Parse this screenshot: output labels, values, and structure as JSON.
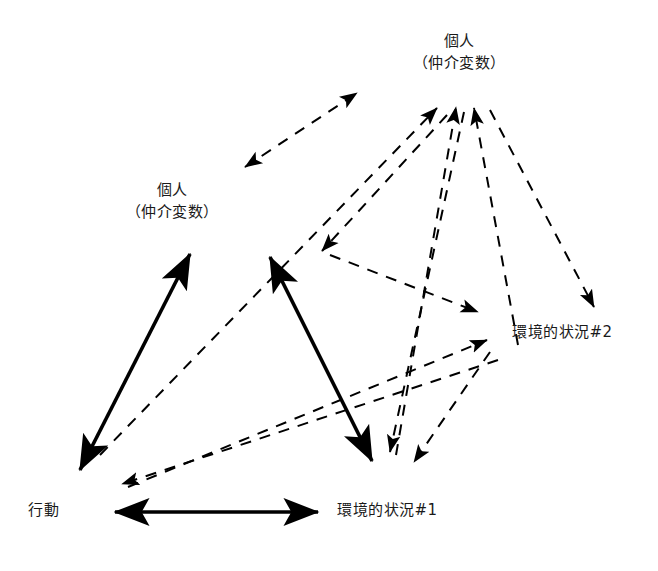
{
  "diagram": {
    "background_color": "#ffffff",
    "stroke_color": "#000000",
    "nodes": [
      {
        "id": "person-top",
        "line1": "個人",
        "line2": "（仲介変数）",
        "x": 459,
        "y": 60
      },
      {
        "id": "person-left",
        "line1": "個人",
        "line2": "（仲介変数）",
        "x": 172,
        "y": 209
      },
      {
        "id": "env2",
        "line1": "環境的状況#2",
        "line2": "",
        "x": 582,
        "y": 336
      },
      {
        "id": "env1",
        "line1": "環境的状況#1",
        "line2": "",
        "x": 407,
        "y": 514
      },
      {
        "id": "behavior",
        "line1": "行動",
        "line2": "",
        "x": 48,
        "y": 514
      }
    ],
    "edges": [
      {
        "id": "solid-person-left-behavior",
        "style": "solid",
        "heads": "both",
        "from": "person-left",
        "to": "behavior",
        "x1": 190,
        "y1": 254,
        "x2": 80,
        "y2": 470
      },
      {
        "id": "solid-person-left2-env1",
        "style": "solid",
        "heads": "both",
        "from": "person-left",
        "to": "env1",
        "x1": 270,
        "y1": 257,
        "x2": 372,
        "y2": 461
      },
      {
        "id": "solid-behavior-env1",
        "style": "solid",
        "heads": "both",
        "from": "behavior",
        "to": "env1",
        "x1": 115,
        "y1": 512,
        "x2": 318,
        "y2": 512
      },
      {
        "id": "dashed-person-left-person-top",
        "style": "dashed",
        "heads": "both",
        "from": "person-left",
        "to": "person-top",
        "x1": 245,
        "y1": 167,
        "x2": 357,
        "y2": 93
      },
      {
        "id": "dashed-behavior-person-top",
        "style": "dashed",
        "heads": "end",
        "from": "behavior",
        "to": "person-top",
        "x1": 100,
        "y1": 455,
        "x2": 437,
        "y2": 108
      },
      {
        "id": "dashed-env1-person-top",
        "style": "dashed",
        "heads": "end",
        "from": "env1",
        "to": "person-top",
        "x1": 396,
        "y1": 455,
        "x2": 456,
        "y2": 107
      },
      {
        "id": "dashed-env2-person-top",
        "style": "dashed",
        "heads": "end",
        "from": "env2",
        "to": "person-top",
        "x1": 518,
        "y1": 345,
        "x2": 474,
        "y2": 108
      },
      {
        "id": "dashed-person-top-env2",
        "style": "dashed",
        "heads": "end",
        "from": "person-top",
        "to": "env2",
        "x1": 490,
        "y1": 110,
        "x2": 594,
        "y2": 307
      },
      {
        "id": "dashed-person-top-person-left-mid",
        "style": "dashed",
        "heads": "end",
        "from": "person-top",
        "to": "person-left",
        "x1": 447,
        "y1": 115,
        "x2": 322,
        "y2": 251
      },
      {
        "id": "dashed-person-left-env2",
        "style": "dashed",
        "heads": "end",
        "from": "person-left",
        "to": "env2",
        "x1": 330,
        "y1": 255,
        "x2": 478,
        "y2": 312
      },
      {
        "id": "dashed-behavior-env2",
        "style": "dashed",
        "heads": "end",
        "from": "behavior",
        "to": "env2",
        "x1": 128,
        "y1": 487,
        "x2": 487,
        "y2": 340
      },
      {
        "id": "dashed-env2-behavior",
        "style": "dashed",
        "heads": "end",
        "from": "env2",
        "to": "behavior",
        "x1": 498,
        "y1": 360,
        "x2": 122,
        "y2": 484
      },
      {
        "id": "dashed-person-top-env1",
        "style": "dashed",
        "heads": "end",
        "from": "person-top",
        "to": "env1",
        "x1": 464,
        "y1": 112,
        "x2": 390,
        "y2": 452
      },
      {
        "id": "dashed-env2-env1",
        "style": "dashed",
        "heads": "end",
        "from": "env2",
        "to": "env1",
        "x1": 490,
        "y1": 352,
        "x2": 414,
        "y2": 462
      }
    ]
  }
}
